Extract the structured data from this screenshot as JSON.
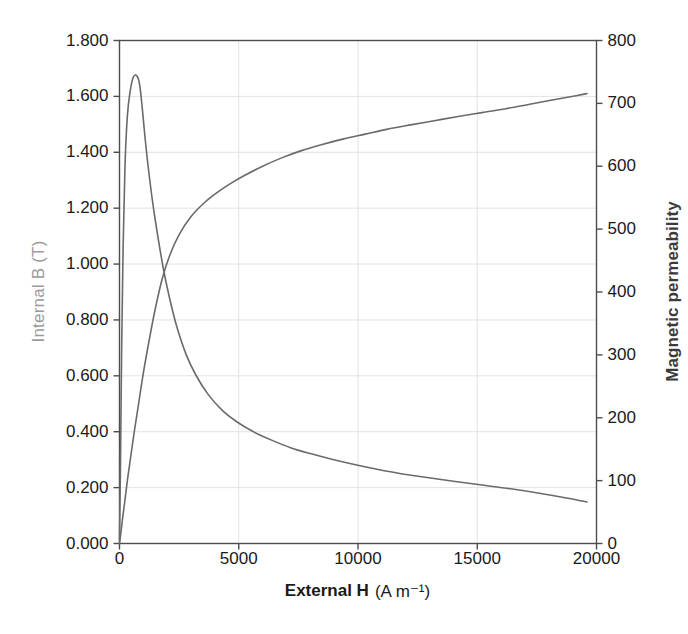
{
  "chart_data": {
    "type": "line",
    "title": "",
    "xlabel": "External H (A m−1)",
    "xlabel_bold": "External H",
    "xlabel_unit": "(A m⁻¹)",
    "xlim": [
      0,
      20000
    ],
    "xticks": [
      0,
      5000,
      10000,
      15000,
      20000
    ],
    "xtick_labels": [
      "0",
      "5000",
      "10000",
      "15000",
      "20000"
    ],
    "grid": true,
    "legend": "none",
    "axes": [
      {
        "id": "left",
        "label": "Internal B (T)",
        "color": "#9b9b9b",
        "lim": [
          0.0,
          1.8
        ],
        "ticks": [
          0.0,
          0.2,
          0.4,
          0.6,
          0.8,
          1.0,
          1.2,
          1.4,
          1.6,
          1.8
        ],
        "tick_labels": [
          "0.000",
          "0.200",
          "0.400",
          "0.600",
          "0.800",
          "1.000",
          "1.200",
          "1.400",
          "1.600",
          "1.800"
        ]
      },
      {
        "id": "right",
        "label": "Magnetic permeability",
        "color": "#3b3b3b",
        "lim": [
          0,
          800
        ],
        "ticks": [
          0,
          100,
          200,
          300,
          400,
          500,
          600,
          700,
          800
        ],
        "tick_labels": [
          "0",
          "100",
          "200",
          "300",
          "400",
          "500",
          "600",
          "700",
          "800"
        ]
      }
    ],
    "series": [
      {
        "name": "Internal B (T)",
        "axis": "left",
        "color": "#6a6a6a",
        "x": [
          0,
          60,
          130,
          220,
          330,
          460,
          620,
          800,
          1000,
          1250,
          1500,
          1800,
          2100,
          2500,
          3000,
          3500,
          4000,
          4600,
          5200,
          6000,
          6800,
          7600,
          8500,
          9400,
          10300,
          11200,
          12200,
          13200,
          14200,
          15200,
          16200,
          17200,
          18200,
          19200,
          19600
        ],
        "y": [
          0.0,
          0.04,
          0.09,
          0.15,
          0.225,
          0.305,
          0.4,
          0.5,
          0.61,
          0.73,
          0.84,
          0.95,
          1.03,
          1.105,
          1.17,
          1.215,
          1.25,
          1.285,
          1.315,
          1.35,
          1.38,
          1.405,
          1.428,
          1.448,
          1.465,
          1.482,
          1.498,
          1.513,
          1.528,
          1.542,
          1.556,
          1.572,
          1.588,
          1.603,
          1.61
        ]
      },
      {
        "name": "Magnetic permeability",
        "axis": "right",
        "color": "#6a6a6a",
        "x": [
          0,
          40,
          90,
          150,
          230,
          330,
          450,
          560,
          660,
          760,
          820,
          880,
          960,
          1060,
          1200,
          1400,
          1600,
          1850,
          2100,
          2400,
          2800,
          3200,
          3700,
          4300,
          4900,
          5600,
          6400,
          7200,
          8000,
          8900,
          9800,
          10800,
          11800,
          12900,
          14000,
          15200,
          16400,
          17600,
          18800,
          19600
        ],
        "y": [
          5,
          120,
          310,
          470,
          600,
          680,
          720,
          740,
          745,
          742,
          735,
          720,
          690,
          650,
          600,
          540,
          490,
          435,
          390,
          345,
          300,
          268,
          238,
          212,
          194,
          178,
          164,
          152,
          143,
          134,
          126,
          118,
          111,
          105,
          99,
          93,
          87,
          80,
          72,
          66
        ]
      }
    ]
  }
}
